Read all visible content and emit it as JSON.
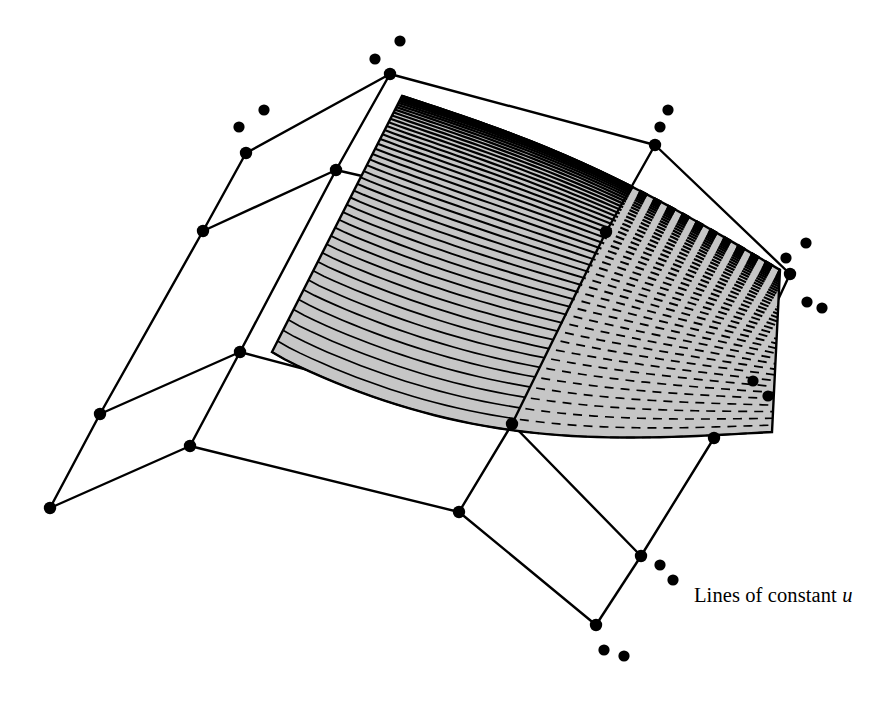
{
  "figure": {
    "kind": "bspline-surface-isoparametric-diagram",
    "background_color": "#ffffff",
    "ink_color": "#000000",
    "surface_fill_color": "#c6c6c6",
    "width": 895,
    "height": 713
  },
  "caption": {
    "prefix": "Lines of constant ",
    "symbol": "u",
    "full_text": "Lines of constant u",
    "x": 694,
    "y": 584
  },
  "chart_data": {
    "type": "line",
    "title": "Lines of constant u",
    "xlabel": "",
    "ylabel": "",
    "legend": [
      "Lines of constant u"
    ],
    "surface_outline": "M 402,96 L 272,352 C 300,370 370,390 470,402 C 560,412 660,424 772,432 L 780,270 C 700,220 600,160 402,96 Z",
    "surface_patch_path": "M 402,96 C 360,180 318,268 272,352 C 300,370 370,390 470,402 C 560,412 665,426 772,432 C 775,378 778,322 780,270 C 700,216 556,156 402,96 Z",
    "iso_curve_count": 46,
    "solid_curve_count": 26,
    "dashed_curve_count": 20,
    "dash_pattern": "9 7",
    "control_polygon_vertices": [
      {
        "id": "v-left-bottom",
        "x": 50,
        "y": 508
      },
      {
        "id": "v-left-mid",
        "x": 100,
        "y": 414
      },
      {
        "id": "v-left-upper",
        "x": 203,
        "y": 231
      },
      {
        "id": "v-left-top",
        "x": 246,
        "y": 153
      },
      {
        "id": "v-center-low",
        "x": 190,
        "y": 446
      },
      {
        "id": "v-center-mid",
        "x": 240,
        "y": 352
      },
      {
        "id": "v-center-up",
        "x": 336,
        "y": 170
      },
      {
        "id": "v-apex",
        "x": 390,
        "y": 74
      },
      {
        "id": "v-bottom-mid",
        "x": 459,
        "y": 512
      },
      {
        "id": "v-mid-seam-low",
        "x": 512,
        "y": 424
      },
      {
        "id": "v-mid-seam-mid",
        "x": 606,
        "y": 232
      },
      {
        "id": "v-mid-seam-top",
        "x": 655,
        "y": 145
      },
      {
        "id": "v-right-bottom",
        "x": 641,
        "y": 556
      },
      {
        "id": "v-right-low",
        "x": 714,
        "y": 438
      },
      {
        "id": "v-right-mid",
        "x": 790,
        "y": 274
      },
      {
        "id": "v-bottom-far",
        "x": 596,
        "y": 625
      }
    ],
    "control_polygon_edges": [
      [
        "v-left-bottom",
        "v-left-mid"
      ],
      [
        "v-left-mid",
        "v-left-upper"
      ],
      [
        "v-left-upper",
        "v-left-top"
      ],
      [
        "v-left-bottom",
        "v-center-low"
      ],
      [
        "v-left-mid",
        "v-center-mid"
      ],
      [
        "v-left-upper",
        "v-center-up"
      ],
      [
        "v-left-top",
        "v-apex"
      ],
      [
        "v-center-low",
        "v-center-mid"
      ],
      [
        "v-center-mid",
        "v-center-up"
      ],
      [
        "v-center-up",
        "v-apex"
      ],
      [
        "v-center-low",
        "v-bottom-mid"
      ],
      [
        "v-center-mid",
        "v-mid-seam-low"
      ],
      [
        "v-center-up",
        "v-mid-seam-mid"
      ],
      [
        "v-apex",
        "v-mid-seam-top"
      ],
      [
        "v-bottom-mid",
        "v-mid-seam-low"
      ],
      [
        "v-mid-seam-low",
        "v-mid-seam-mid"
      ],
      [
        "v-mid-seam-mid",
        "v-mid-seam-top"
      ],
      [
        "v-bottom-mid",
        "v-bottom-far"
      ],
      [
        "v-mid-seam-low",
        "v-right-bottom"
      ],
      [
        "v-mid-seam-mid",
        "v-right-low"
      ],
      [
        "v-mid-seam-top",
        "v-right-mid"
      ],
      [
        "v-bottom-far",
        "v-right-bottom"
      ],
      [
        "v-right-bottom",
        "v-right-low"
      ],
      [
        "v-right-low",
        "v-right-mid"
      ]
    ],
    "free_control_points": [
      {
        "x": 264,
        "y": 110
      },
      {
        "x": 239,
        "y": 127
      },
      {
        "x": 400,
        "y": 41
      },
      {
        "x": 375,
        "y": 59
      },
      {
        "x": 668,
        "y": 110
      },
      {
        "x": 660,
        "y": 127
      },
      {
        "x": 806,
        "y": 243
      },
      {
        "x": 786,
        "y": 258
      },
      {
        "x": 807,
        "y": 302
      },
      {
        "x": 822,
        "y": 308
      },
      {
        "x": 753,
        "y": 381
      },
      {
        "x": 768,
        "y": 396
      },
      {
        "x": 660,
        "y": 565
      },
      {
        "x": 673,
        "y": 580
      },
      {
        "x": 604,
        "y": 650
      },
      {
        "x": 624,
        "y": 656
      }
    ],
    "control_point_radius": 6.2,
    "free_point_radius": 5.6,
    "line_width": 2.4
  }
}
